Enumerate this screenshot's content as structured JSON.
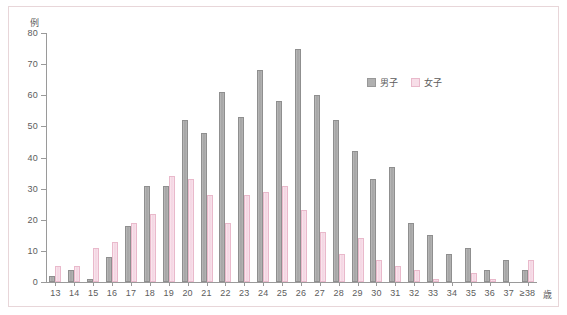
{
  "chart_data": {
    "type": "bar",
    "title": "",
    "xlabel": "歳",
    "ylabel": "例",
    "ylim": [
      0,
      80
    ],
    "yticks": [
      0,
      10,
      20,
      30,
      40,
      50,
      60,
      70,
      80
    ],
    "grid": false,
    "legend_position": "upper-right-inside",
    "categories": [
      "13",
      "14",
      "15",
      "16",
      "17",
      "18",
      "19",
      "20",
      "21",
      "22",
      "23",
      "24",
      "25",
      "26",
      "27",
      "28",
      "29",
      "30",
      "31",
      "32",
      "33",
      "34",
      "35",
      "36",
      "37",
      "≥38"
    ],
    "series": [
      {
        "name": "男子",
        "color": "#a8a8a8",
        "values": [
          2,
          4,
          1,
          8,
          18,
          31,
          31,
          52,
          48,
          61,
          53,
          68,
          58,
          75,
          60,
          52,
          42,
          33,
          37,
          19,
          15,
          9,
          11,
          4,
          7,
          4
        ]
      },
      {
        "name": "女子",
        "color": "#f6dce6",
        "values": [
          5,
          5,
          11,
          13,
          19,
          22,
          34,
          33,
          28,
          19,
          28,
          29,
          31,
          23,
          16,
          9,
          14,
          7,
          5,
          4,
          1,
          0,
          3,
          1,
          0,
          7
        ]
      }
    ]
  },
  "axes": {
    "y_unit": "例",
    "x_unit": "歳"
  },
  "legend": {
    "items": [
      {
        "label": "男子",
        "swatch": "male"
      },
      {
        "label": "女子",
        "swatch": "female"
      }
    ]
  }
}
